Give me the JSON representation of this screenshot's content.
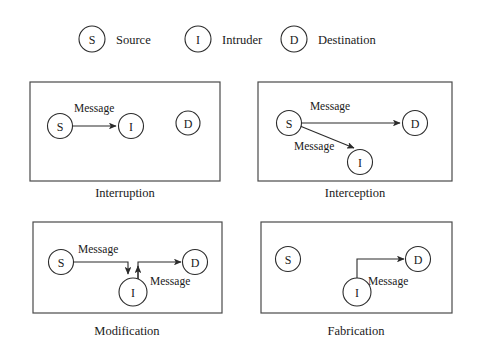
{
  "figure": {
    "colors": {
      "background": "#ffffff",
      "node_stroke": "#2b2b2b",
      "panel_stroke": "#4a4a4a",
      "text": "#1a1a1a"
    },
    "legend": [
      {
        "symbol": "S",
        "label": "Source"
      },
      {
        "symbol": "I",
        "label": "Intruder"
      },
      {
        "symbol": "D",
        "label": "Destination"
      }
    ],
    "panels": [
      {
        "caption": "Interruption",
        "nodes": [
          {
            "symbol": "S",
            "cx": 60,
            "cy": 126
          },
          {
            "symbol": "I",
            "cx": 131,
            "cy": 126
          },
          {
            "symbol": "D",
            "cx": 188,
            "cy": 123
          }
        ],
        "edges": [
          {
            "label": "Message",
            "label_x": 74,
            "label_y": 108,
            "from": "S",
            "to": "I"
          }
        ]
      },
      {
        "caption": "Interception",
        "nodes": [
          {
            "symbol": "S",
            "cx": 289,
            "cy": 123
          },
          {
            "symbol": "D",
            "cx": 415,
            "cy": 123
          },
          {
            "symbol": "I",
            "cx": 360,
            "cy": 162
          }
        ],
        "edges": [
          {
            "label": "Message",
            "label_x": 330,
            "label_y": 106,
            "from": "S",
            "to": "D"
          },
          {
            "label": "Message",
            "label_x": 294,
            "label_y": 146,
            "from": "S",
            "to": "I"
          }
        ]
      },
      {
        "caption": "Modification",
        "nodes": [
          {
            "symbol": "S",
            "cx": 61,
            "cy": 262
          },
          {
            "symbol": "D",
            "cx": 195,
            "cy": 262
          },
          {
            "symbol": "I",
            "cx": 133,
            "cy": 292
          }
        ],
        "edges": [
          {
            "label": "Message",
            "label_x": 78,
            "label_y": 249,
            "from": "S",
            "to": "I"
          },
          {
            "label": "Message",
            "label_x": 150,
            "label_y": 281,
            "from": "I",
            "to": "D"
          }
        ]
      },
      {
        "caption": "Fabrication",
        "nodes": [
          {
            "symbol": "S",
            "cx": 288,
            "cy": 259
          },
          {
            "symbol": "D",
            "cx": 418,
            "cy": 259
          },
          {
            "symbol": "I",
            "cx": 357,
            "cy": 292
          }
        ],
        "edges": [
          {
            "label": "Message",
            "label_x": 368,
            "label_y": 281,
            "from": "I",
            "to": "D"
          }
        ]
      }
    ]
  }
}
